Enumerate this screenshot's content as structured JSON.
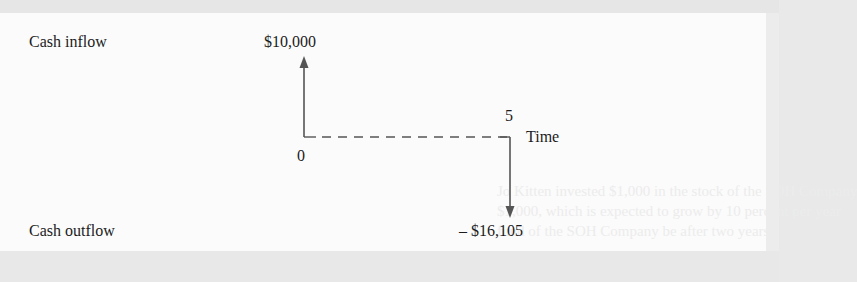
{
  "diagram": {
    "type": "cash-flow-timeline",
    "labels": {
      "cash_inflow": "Cash inflow",
      "cash_outflow": "Cash outflow",
      "inflow_amount": "$10,000",
      "outflow_amount": "– $16,105",
      "time_start": "0",
      "time_end": "5",
      "time_axis": "Time"
    },
    "ghost_text": {
      "line1": "Jo Kitten invested $1,000 in the stock of the SOH Company",
      "line2": "$1,000, which is expected to grow by 10 percent per year",
      "line3": "fund of the SOH Company be after two years?"
    },
    "flows": [
      {
        "period": 0,
        "amount": 10000,
        "direction": "inflow"
      },
      {
        "period": 5,
        "amount": -16105,
        "direction": "outflow"
      }
    ],
    "colors": {
      "text": "#1c1c1c",
      "arrow": "#555555",
      "panel": "#fbfbfb",
      "background": "#e8e8e8"
    }
  }
}
